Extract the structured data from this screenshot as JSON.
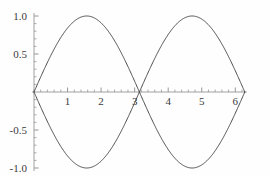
{
  "chart_data": {
    "type": "line",
    "title": "",
    "xlabel": "",
    "ylabel": "",
    "xlim": [
      0,
      6.283185
    ],
    "ylim": [
      -1.0,
      1.0
    ],
    "grid": false,
    "legend": "none",
    "axes_style": "crossing-at-origin",
    "x_ticks_major": [
      1,
      2,
      3,
      4,
      5,
      6
    ],
    "x_tick_labels": [
      "1",
      "2",
      "3",
      "4",
      "5",
      "6"
    ],
    "x_tick_minor_step": 0.2,
    "y_ticks_major": [
      -1.0,
      -0.5,
      0.5,
      1.0
    ],
    "y_tick_labels": [
      "-1.0",
      "-0.5",
      "0.5",
      "1.0"
    ],
    "y_tick_minor_step": 0.1,
    "line_color": "#4a4a4a",
    "axis_color": "#8c8c8c",
    "series": [
      {
        "name": "sin(x)",
        "expression": "sin(x)",
        "color": "#4a4a4a",
        "points": [
          [
            0.0,
            0.0
          ],
          [
            0.15708,
            0.15643
          ],
          [
            0.31416,
            0.30902
          ],
          [
            0.47124,
            0.45399
          ],
          [
            0.62832,
            0.58779
          ],
          [
            0.7854,
            0.70711
          ],
          [
            0.94248,
            0.80902
          ],
          [
            1.09956,
            0.89101
          ],
          [
            1.25664,
            0.95106
          ],
          [
            1.41372,
            0.98769
          ],
          [
            1.5708,
            1.0
          ],
          [
            1.72788,
            0.98769
          ],
          [
            1.88496,
            0.95106
          ],
          [
            2.04204,
            0.89101
          ],
          [
            2.19911,
            0.80902
          ],
          [
            2.35619,
            0.70711
          ],
          [
            2.51327,
            0.58779
          ],
          [
            2.67035,
            0.45399
          ],
          [
            2.82743,
            0.30902
          ],
          [
            2.98451,
            0.15643
          ],
          [
            3.14159,
            0.0
          ],
          [
            3.29867,
            -0.15643
          ],
          [
            3.45575,
            -0.30902
          ],
          [
            3.61283,
            -0.45399
          ],
          [
            3.76991,
            -0.58779
          ],
          [
            3.92699,
            -0.70711
          ],
          [
            4.08407,
            -0.80902
          ],
          [
            4.24115,
            -0.89101
          ],
          [
            4.39823,
            -0.95106
          ],
          [
            4.55531,
            -0.98769
          ],
          [
            4.71239,
            -1.0
          ],
          [
            4.86947,
            -0.98769
          ],
          [
            5.02655,
            -0.95106
          ],
          [
            5.18363,
            -0.89101
          ],
          [
            5.34071,
            -0.80902
          ],
          [
            5.49779,
            -0.70711
          ],
          [
            5.65487,
            -0.58779
          ],
          [
            5.81195,
            -0.45399
          ],
          [
            5.96903,
            -0.30902
          ],
          [
            6.12611,
            -0.15643
          ],
          [
            6.28319,
            0.0
          ]
        ]
      },
      {
        "name": "-sin(x)",
        "expression": "-sin(x)",
        "color": "#4a4a4a",
        "points": [
          [
            0.0,
            0.0
          ],
          [
            0.15708,
            -0.15643
          ],
          [
            0.31416,
            -0.30902
          ],
          [
            0.47124,
            -0.45399
          ],
          [
            0.62832,
            -0.58779
          ],
          [
            0.7854,
            -0.70711
          ],
          [
            0.94248,
            -0.80902
          ],
          [
            1.09956,
            -0.89101
          ],
          [
            1.25664,
            -0.95106
          ],
          [
            1.41372,
            -0.98769
          ],
          [
            1.5708,
            -1.0
          ],
          [
            1.72788,
            -0.98769
          ],
          [
            1.88496,
            -0.95106
          ],
          [
            2.04204,
            -0.89101
          ],
          [
            2.19911,
            -0.80902
          ],
          [
            2.35619,
            -0.70711
          ],
          [
            2.51327,
            -0.58779
          ],
          [
            2.67035,
            -0.45399
          ],
          [
            2.82743,
            -0.30902
          ],
          [
            2.98451,
            -0.15643
          ],
          [
            3.14159,
            0.0
          ],
          [
            3.29867,
            0.15643
          ],
          [
            3.45575,
            0.30902
          ],
          [
            3.61283,
            0.45399
          ],
          [
            3.76991,
            0.58779
          ],
          [
            3.92699,
            0.70711
          ],
          [
            4.08407,
            0.80902
          ],
          [
            4.24115,
            0.89101
          ],
          [
            4.39823,
            0.95106
          ],
          [
            4.55531,
            0.98769
          ],
          [
            4.71239,
            1.0
          ],
          [
            4.86947,
            0.98769
          ],
          [
            5.02655,
            0.95106
          ],
          [
            5.18363,
            0.89101
          ],
          [
            5.34071,
            0.80902
          ],
          [
            5.49779,
            0.70711
          ],
          [
            5.65487,
            0.58779
          ],
          [
            5.81195,
            0.45399
          ],
          [
            5.96903,
            0.30902
          ],
          [
            6.12611,
            0.15643
          ],
          [
            6.28319,
            0.0
          ]
        ]
      }
    ]
  }
}
